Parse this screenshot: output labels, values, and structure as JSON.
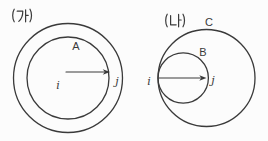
{
  "figures": {
    "left": {
      "caption": "(가)",
      "inner_circle_label": "A",
      "center_point_label": "i",
      "arrow_tip_label": "j",
      "description": "two concentric circles with horizontal radius arrow from center i to point j on inner circle"
    },
    "right": {
      "caption": "(나)",
      "outer_circle_label": "C",
      "inner_circle_label": "B",
      "tangent_point_label": "i",
      "arrow_tip_label": "j",
      "description": "small circle B internally tangent to large circle C at point i, arrow along diameter of B from i to j"
    }
  },
  "colors": {
    "stroke": "#3a3a3a",
    "background": "#fcfcfc"
  }
}
